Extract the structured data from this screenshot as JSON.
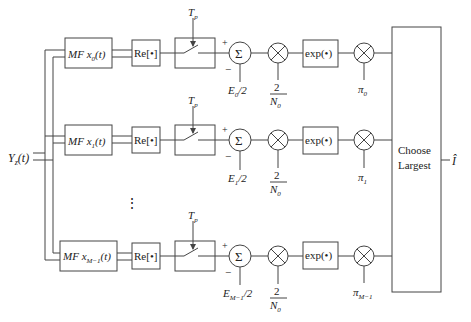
{
  "diagram": {
    "input": {
      "label": "Y",
      "sub": "z",
      "suffix": "(t)"
    },
    "output": {
      "label": "Î"
    },
    "decision_block": {
      "line1": "Choose",
      "line2": "Largest"
    },
    "ellipsis": "⋮",
    "branches": [
      {
        "mf": {
          "prefix": "MF ",
          "var": "x",
          "sub": "0",
          "suffix": "(t)"
        },
        "re": "Re[•]",
        "switch": {
          "label": "T",
          "sub": "p"
        },
        "sum": {
          "symbol": "Σ",
          "plus": "+",
          "minus": "−"
        },
        "energy": {
          "var": "E",
          "sub": "0",
          "suffix": "/2"
        },
        "gain": {
          "num": "2",
          "den": "N",
          "den_sub": "0"
        },
        "exp": "exp(•)",
        "prior": {
          "var": "π",
          "sub": "0"
        }
      },
      {
        "mf": {
          "prefix": "MF ",
          "var": "x",
          "sub": "1",
          "suffix": "(t)"
        },
        "re": "Re[•]",
        "switch": {
          "label": "T",
          "sub": "p"
        },
        "sum": {
          "symbol": "Σ",
          "plus": "+",
          "minus": "−"
        },
        "energy": {
          "var": "E",
          "sub": "1",
          "suffix": "/2"
        },
        "gain": {
          "num": "2",
          "den": "N",
          "den_sub": "0"
        },
        "exp": "exp(•)",
        "prior": {
          "var": "π",
          "sub": "1"
        }
      },
      {
        "mf": {
          "prefix": "MF ",
          "var": "x",
          "sub": "M−1",
          "suffix": "(t)"
        },
        "re": "Re[•]",
        "switch": {
          "label": "T",
          "sub": "p"
        },
        "sum": {
          "symbol": "Σ",
          "plus": "+",
          "minus": "−"
        },
        "energy": {
          "var": "E",
          "sub": "M−1",
          "suffix": "/2"
        },
        "gain": {
          "num": "2",
          "den": "N",
          "den_sub": "0"
        },
        "exp": "exp(•)",
        "prior": {
          "var": "π",
          "sub": "M−1"
        }
      }
    ]
  }
}
